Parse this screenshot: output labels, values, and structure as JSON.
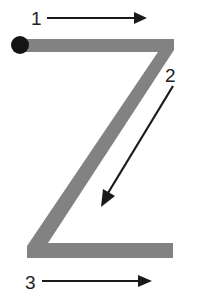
{
  "diagram": {
    "title": "",
    "letter": "Z",
    "colors": {
      "background": "#ffffff",
      "stroke_fill": "#828282",
      "arrow": "#1a1a1a",
      "start_dot": "#141414",
      "label": "#222222"
    },
    "letter_shape": {
      "points": "20,39 174,39 174,50 48,243 173,243 173,258 27,258 27,246 158,52 20,52"
    },
    "start_dot": {
      "cx": 20,
      "cy": 45,
      "r": 9
    },
    "steps": [
      {
        "label": "1",
        "label_x": 31,
        "label_y": 25,
        "x1": 47,
        "y1": 18,
        "x2": 134,
        "y2": 18,
        "head": "134,12 147,18 134,24",
        "direction": "right"
      },
      {
        "label": "2",
        "label_x": 165,
        "label_y": 82,
        "x1": 173,
        "y1": 86,
        "x2": 108,
        "y2": 193,
        "head": "101,207 103,189 115,196",
        "direction": "down-left"
      },
      {
        "label": "3",
        "label_x": 25,
        "label_y": 289,
        "x1": 42,
        "y1": 281,
        "x2": 138,
        "y2": 281,
        "head": "138,275 152,281 138,287",
        "direction": "right"
      }
    ]
  }
}
